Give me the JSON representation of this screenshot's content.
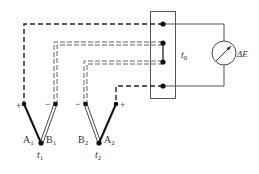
{
  "diagram": {
    "colors": {
      "wire": "#222222",
      "box": "#555555",
      "background": "#ffffff"
    },
    "reference_block": {
      "label": "t",
      "label_sub": "0",
      "terminals": 4
    },
    "meter": {
      "label": "ΔE",
      "icon": "galvanometer-icon"
    },
    "thermocouples": [
      {
        "junction_label": "t",
        "junction_sub": "1",
        "left_leg": {
          "label": "A",
          "sub": "1",
          "polarity": "+"
        },
        "right_leg": {
          "label": "B",
          "sub": "1",
          "polarity": "−"
        }
      },
      {
        "junction_label": "t",
        "junction_sub": "2",
        "left_leg": {
          "label": "B",
          "sub": "2",
          "polarity": "−"
        },
        "right_leg": {
          "label": "A",
          "sub": "2",
          "polarity": "+"
        }
      }
    ]
  }
}
